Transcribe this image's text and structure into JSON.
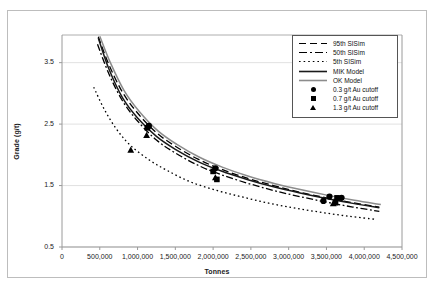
{
  "chart_data": {
    "type": "line",
    "title": "",
    "xlabel": "Tonnes",
    "ylabel": "Grade (g/t)",
    "xlim": [
      0,
      4500000
    ],
    "ylim": [
      0.5,
      3.95
    ],
    "grid": "horizontal",
    "legend_position": "top-right",
    "xticks": [
      0,
      500000,
      1000000,
      1500000,
      2000000,
      2500000,
      3000000,
      3500000,
      4000000,
      4500000
    ],
    "xtick_labels": [
      "0",
      "500,000",
      "1,000,000",
      "1,500,000",
      "2,000,000",
      "2,500,000",
      "3,000,000",
      "3,500,000",
      "4,000,000",
      "4,500,000"
    ],
    "yticks": [
      0.5,
      1.5,
      2.5,
      3.5
    ],
    "ytick_labels": [
      "0.5",
      "1.5",
      "2.5",
      "3.5"
    ],
    "series": [
      {
        "name": "95th SISim",
        "style": "dashed",
        "color": "#000000",
        "x": [
          480000,
          620000,
          800000,
          1000000,
          1250000,
          1500000,
          1800000,
          2100000,
          2450000,
          2800000,
          3150000,
          3500000,
          3850000,
          4200000
        ],
        "y": [
          3.92,
          3.47,
          3.02,
          2.68,
          2.36,
          2.14,
          1.93,
          1.77,
          1.62,
          1.5,
          1.39,
          1.3,
          1.22,
          1.15
        ]
      },
      {
        "name": "50th SISim",
        "style": "dash-dot",
        "color": "#000000",
        "x": [
          470000,
          620000,
          800000,
          1000000,
          1250000,
          1500000,
          1800000,
          2100000,
          2450000,
          2800000,
          3150000,
          3500000,
          3850000,
          4200000
        ],
        "y": [
          3.8,
          3.32,
          2.88,
          2.55,
          2.24,
          2.03,
          1.83,
          1.68,
          1.54,
          1.42,
          1.32,
          1.23,
          1.15,
          1.08
        ]
      },
      {
        "name": "5th SISim",
        "style": "dotted",
        "color": "#000000",
        "x": [
          420000,
          560000,
          720000,
          900000,
          1150000,
          1400000,
          1700000,
          2050000,
          2400000,
          2750000,
          3100000,
          3450000,
          3800000,
          4150000
        ],
        "y": [
          3.1,
          2.74,
          2.42,
          2.16,
          1.92,
          1.74,
          1.56,
          1.42,
          1.31,
          1.21,
          1.13,
          1.06,
          1.0,
          0.95
        ]
      },
      {
        "name": "MIK Model",
        "style": "solid",
        "color": "#1a1a1a",
        "x": [
          480000,
          620000,
          800000,
          1000000,
          1250000,
          1500000,
          1800000,
          2100000,
          2450000,
          2800000,
          3150000,
          3500000,
          3850000,
          4200000
        ],
        "y": [
          3.9,
          3.4,
          2.93,
          2.6,
          2.3,
          2.09,
          1.89,
          1.74,
          1.6,
          1.48,
          1.38,
          1.29,
          1.21,
          1.14
        ]
      },
      {
        "name": "OK Model",
        "style": "solid",
        "color": "#8c8c8c",
        "x": [
          500000,
          640000,
          820000,
          1020000,
          1270000,
          1520000,
          1820000,
          2120000,
          2470000,
          2820000,
          3170000,
          3520000,
          3870000,
          4220000
        ],
        "y": [
          3.93,
          3.5,
          3.05,
          2.71,
          2.39,
          2.17,
          1.96,
          1.8,
          1.65,
          1.53,
          1.43,
          1.34,
          1.26,
          1.19
        ]
      }
    ],
    "markers": [
      {
        "name": "0.3 g/t Au cutoff",
        "shape": "circle",
        "points": [
          {
            "x": 1150000,
            "y": 2.47
          },
          {
            "x": 2030000,
            "y": 1.78
          },
          {
            "x": 3540000,
            "y": 1.32
          },
          {
            "x": 3700000,
            "y": 1.3
          },
          {
            "x": 3460000,
            "y": 1.25
          }
        ]
      },
      {
        "name": "0.7 g/t Au cutoff",
        "shape": "square",
        "points": [
          {
            "x": 1130000,
            "y": 2.44
          },
          {
            "x": 2000000,
            "y": 1.73
          },
          {
            "x": 2050000,
            "y": 1.6
          },
          {
            "x": 3640000,
            "y": 1.3
          },
          {
            "x": 3620000,
            "y": 1.22
          }
        ]
      },
      {
        "name": "1.3 g/t Au cutoff",
        "shape": "triangle",
        "points": [
          {
            "x": 1120000,
            "y": 2.32
          },
          {
            "x": 910000,
            "y": 2.08
          },
          {
            "x": 2030000,
            "y": 1.63
          },
          {
            "x": 3590000,
            "y": 1.21
          }
        ]
      }
    ],
    "legend": [
      {
        "label": "95th SISim",
        "key": "dashed-line"
      },
      {
        "label": "50th SISim",
        "key": "dash-dot-line"
      },
      {
        "label": "5th SISim",
        "key": "dotted-line"
      },
      {
        "label": "MIK Model",
        "key": "solid-black-line"
      },
      {
        "label": "OK Model",
        "key": "solid-gray-line"
      },
      {
        "label": "0.3 g/t Au cutoff",
        "key": "circle-marker"
      },
      {
        "label": "0.7 g/t Au cutoff",
        "key": "square-marker"
      },
      {
        "label": "1.3 g/t Au cutoff",
        "key": "triangle-marker"
      }
    ],
    "colors": {
      "axis": "#9a9a9a",
      "grid": "#d9d9d9",
      "text": "#1a1a1a",
      "mik": "#1a1a1a",
      "ok": "#8c8c8c",
      "frame": "#bdbdbd"
    }
  }
}
